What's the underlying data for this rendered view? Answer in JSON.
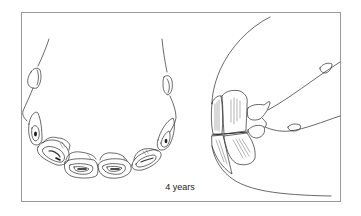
{
  "figure": {
    "caption": "4 years",
    "views": [
      {
        "name": "occlusal-view",
        "description": "Lower incisor arcade viewed from above, showing tables of the teeth and canines"
      },
      {
        "name": "lateral-view",
        "description": "Side view of incisors at the front of the jaw"
      }
    ]
  },
  "colors": {
    "line": "#2a2a2a",
    "frame": "#9a9a9a",
    "background": "#ffffff",
    "shading": "#555555"
  }
}
